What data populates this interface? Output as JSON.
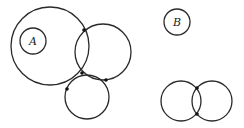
{
  "diagram": {
    "labels": {
      "a": "A",
      "b": "B"
    },
    "left_figure": {
      "circles": [
        {
          "name": "large-circle",
          "cx": 50,
          "cy": 46,
          "r": 39
        },
        {
          "name": "circle-A",
          "cx": 33,
          "cy": 41,
          "r": 13,
          "label": "A"
        },
        {
          "name": "upper-right-circle",
          "cx": 103,
          "cy": 52,
          "r": 28
        },
        {
          "name": "bottom-circle",
          "cx": 87,
          "cy": 97,
          "r": 22
        }
      ],
      "intersection_points": [
        [
          84,
          30
        ],
        [
          82,
          73
        ],
        [
          67,
          89
        ],
        [
          106,
          80
        ]
      ]
    },
    "right_figure": {
      "circles": [
        {
          "name": "circle-B",
          "cx": 177,
          "cy": 22,
          "r": 13,
          "label": "B"
        },
        {
          "name": "pair-left-circle",
          "cx": 181,
          "cy": 101,
          "r": 20
        },
        {
          "name": "pair-right-circle",
          "cx": 212,
          "cy": 101,
          "r": 20
        }
      ],
      "intersection_points": [
        [
          197,
          88
        ],
        [
          197,
          115
        ]
      ]
    },
    "colors": {
      "stroke": "#2a2a2a",
      "dot": "#111111",
      "background": "#ffffff"
    }
  }
}
